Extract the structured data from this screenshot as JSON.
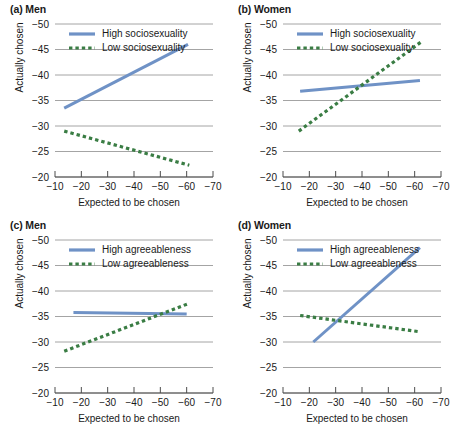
{
  "figure": {
    "axis_labels": {
      "x": "Expected to be chosen",
      "y": "Actually chosen"
    },
    "colors": {
      "high_series": "#6f92c6",
      "low_series": "#3a7d44",
      "gridline": "#9a9a9a",
      "axis": "#4d4d4d",
      "text": "#1a1a1a",
      "background": "#ffffff"
    }
  },
  "chart_data": [
    {
      "type": "line",
      "panel": "a",
      "title": "(a) Men",
      "xlabel": "Expected to be chosen",
      "ylabel": "Actually chosen",
      "xticks": [
        -10,
        -20,
        -30,
        -40,
        -50,
        -60,
        -70
      ],
      "yticks": [
        -50,
        -45,
        -40,
        -35,
        -30,
        -25,
        -20
      ],
      "xlim": [
        -10,
        -70
      ],
      "ylim": [
        -20,
        -50
      ],
      "grid": true,
      "legend_position": "top-left-inside",
      "series": [
        {
          "name": "High sociosexuality",
          "style": "solid",
          "color": "#6f92c6",
          "x": [
            -13.5,
            -60.5
          ],
          "y": [
            -33.5,
            -46.0
          ]
        },
        {
          "name": "Low sociosexuality",
          "style": "dashed",
          "color": "#3a7d44",
          "x": [
            -13.5,
            -61.0
          ],
          "y": [
            -29.0,
            -22.3
          ]
        }
      ]
    },
    {
      "type": "line",
      "panel": "b",
      "title": "(b) Women",
      "xlabel": "Expected to be chosen",
      "ylabel": "Actually chosen",
      "xticks": [
        -10,
        -20,
        -30,
        -40,
        -50,
        -60,
        -70
      ],
      "yticks": [
        -50,
        -45,
        -40,
        -35,
        -30,
        -25,
        -20
      ],
      "xlim": [
        -10,
        -70
      ],
      "ylim": [
        -20,
        -50
      ],
      "grid": true,
      "legend_position": "top-left-inside",
      "series": [
        {
          "name": "High sociosexuality",
          "style": "solid",
          "color": "#6f92c6",
          "x": [
            -16.5,
            -62.0
          ],
          "y": [
            -36.8,
            -38.9
          ]
        },
        {
          "name": "Low sociosexuality",
          "style": "dashed",
          "color": "#3a7d44",
          "x": [
            -16.0,
            -62.5
          ],
          "y": [
            -29.0,
            -46.5
          ]
        }
      ]
    },
    {
      "type": "line",
      "panel": "c",
      "title": "(c) Men",
      "xlabel": "Expected to be chosen",
      "ylabel": "Actually chosen",
      "xticks": [
        -10,
        -20,
        -30,
        -40,
        -50,
        -60,
        -70
      ],
      "yticks": [
        -50,
        -45,
        -40,
        -35,
        -30,
        -25,
        -20
      ],
      "xlim": [
        -10,
        -70
      ],
      "ylim": [
        -20,
        -50
      ],
      "grid": true,
      "legend_position": "top-left-inside",
      "series": [
        {
          "name": "High agreeableness",
          "style": "solid",
          "color": "#6f92c6",
          "x": [
            -17.0,
            -60.0
          ],
          "y": [
            -35.8,
            -35.5
          ]
        },
        {
          "name": "Low agreeableness",
          "style": "dashed",
          "color": "#3a7d44",
          "x": [
            -13.5,
            -60.5
          ],
          "y": [
            -28.2,
            -37.5
          ]
        }
      ]
    },
    {
      "type": "line",
      "panel": "d",
      "title": "(d) Women",
      "xlabel": "Expected to be chosen",
      "ylabel": "Actually chosen",
      "xticks": [
        -10,
        -20,
        -30,
        -40,
        -50,
        -60,
        -70
      ],
      "yticks": [
        -50,
        -45,
        -40,
        -35,
        -30,
        -25,
        -20
      ],
      "xlim": [
        -10,
        -70
      ],
      "ylim": [
        -20,
        -50
      ],
      "grid": true,
      "legend_position": "top-left-inside",
      "series": [
        {
          "name": "High agreeableness",
          "style": "solid",
          "color": "#6f92c6",
          "x": [
            -21.5,
            -62.0
          ],
          "y": [
            -30.0,
            -48.5
          ]
        },
        {
          "name": "Low agreeableness",
          "style": "dashed",
          "color": "#3a7d44",
          "x": [
            -16.5,
            -62.0
          ],
          "y": [
            -35.2,
            -32.0
          ]
        }
      ]
    }
  ]
}
